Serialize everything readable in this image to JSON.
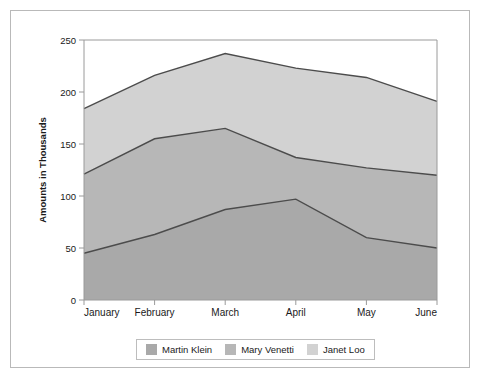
{
  "chart_data": {
    "type": "area",
    "stacked": true,
    "title": "",
    "subtitle": "",
    "xlabel": "",
    "ylabel": "Amounts in Thousands",
    "categories": [
      "January",
      "February",
      "March",
      "April",
      "May",
      "June"
    ],
    "ylim": [
      0,
      250
    ],
    "yticks": [
      0,
      50,
      100,
      150,
      200,
      250
    ],
    "ytick_labels": [
      "0",
      "50",
      "100",
      "150",
      "200",
      "250"
    ],
    "grid": false,
    "legend_position": "bottom",
    "series": [
      {
        "name": "Martin Klein",
        "color": "#a9a9a9",
        "values": [
          45,
          63,
          87,
          97,
          60,
          50
        ],
        "cumulative": [
          45,
          63,
          87,
          97,
          60,
          50
        ]
      },
      {
        "name": "Mary Venetti",
        "color": "#b7b7b7",
        "values": [
          76,
          92,
          78,
          40,
          67,
          70
        ],
        "cumulative": [
          121,
          155,
          165,
          137,
          127,
          120
        ]
      },
      {
        "name": "Janet Loo",
        "color": "#d2d2d2",
        "values": [
          63,
          61,
          72,
          86,
          87,
          71
        ],
        "cumulative": [
          184,
          216,
          237,
          223,
          214,
          191
        ]
      }
    ]
  },
  "legend": {
    "items": [
      {
        "label": "Martin Klein",
        "color": "#a9a9a9"
      },
      {
        "label": "Mary Venetti",
        "color": "#b7b7b7"
      },
      {
        "label": "Janet Loo",
        "color": "#d2d2d2"
      }
    ]
  },
  "axes": {
    "y_title": "Amounts in Thousands",
    "y_ticks": [
      "250",
      "200",
      "150",
      "100",
      "50",
      "0"
    ],
    "x_ticks": [
      "January",
      "February",
      "March",
      "April",
      "May",
      "June"
    ]
  },
  "colors": {
    "series_1": "#a9a9a9",
    "series_2": "#b7b7b7",
    "series_3": "#d2d2d2",
    "line": "#4c4c4c",
    "axis": "#9a9a9a",
    "frame": "#b9b9b9",
    "text": "#1a1a1a"
  }
}
